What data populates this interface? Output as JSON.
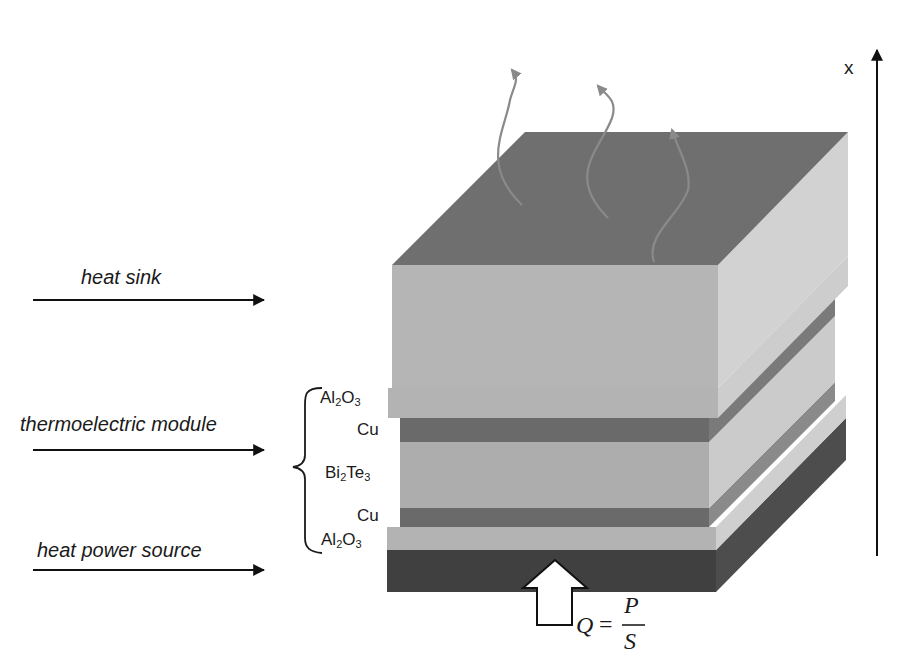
{
  "labels": {
    "heat_sink": "heat sink",
    "thermoelectric_module": "thermoelectric module",
    "heat_power_source": "heat power source",
    "axis": "x"
  },
  "layers": [
    {
      "id": "al2o3_top",
      "base": "Al",
      "sub1": "2",
      "mid": "O",
      "sub2": "3"
    },
    {
      "id": "cu_top",
      "text": "Cu"
    },
    {
      "id": "bi2te3",
      "base": "Bi",
      "sub1": "2",
      "mid": "Te",
      "sub2": "3"
    },
    {
      "id": "cu_bottom",
      "text": "Cu"
    },
    {
      "id": "al2o3_bottom",
      "base": "Al",
      "sub1": "2",
      "mid": "O",
      "sub2": "3"
    }
  ],
  "formula": {
    "lhs": "Q",
    "eq": "=",
    "num": "P",
    "den": "S"
  },
  "colors": {
    "sink_top": "#6f6f6f",
    "sink_front": "#b5b5b5",
    "sink_side": "#d2d2d2",
    "al2o3_front": "#b3b3b3",
    "al2o3_side": "#cfcfcf",
    "cu_front": "#6a6a6a",
    "cu_side": "#8a8a8a",
    "bi2te3_front": "#adadad",
    "bi2te3_side": "#cbcbcb",
    "source_front": "#404040",
    "source_side": "#4d4d4d",
    "heat_wave": "#8a8a8a"
  }
}
